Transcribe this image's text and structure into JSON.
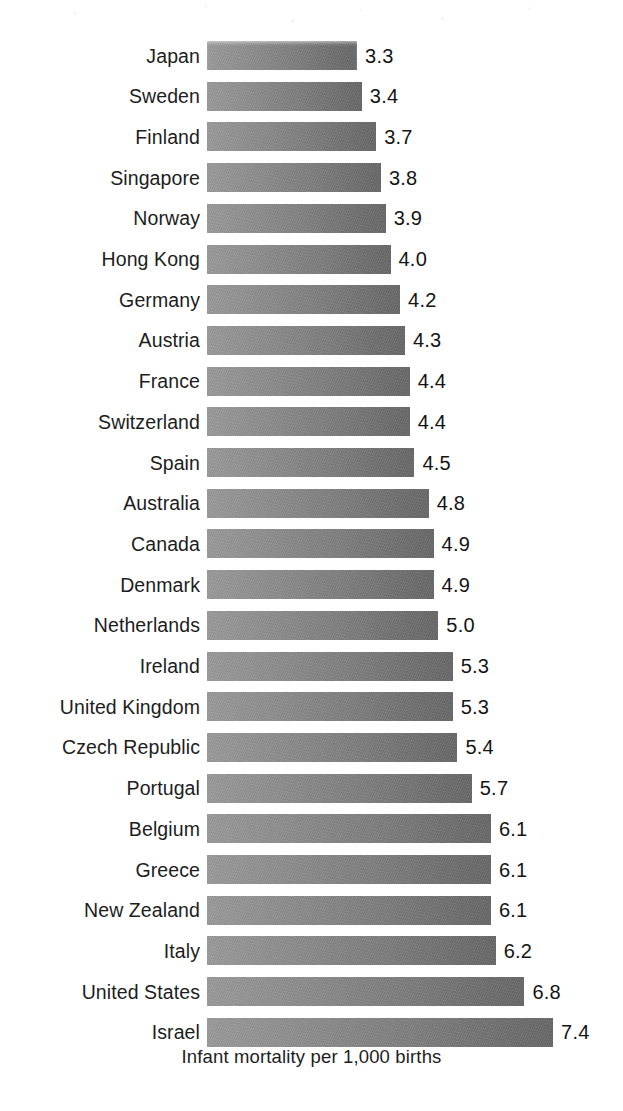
{
  "chart_data": {
    "type": "bar",
    "orientation": "horizontal",
    "title": "",
    "subtitle": "",
    "xlabel": "Infant mortality per 1,000 births",
    "ylabel": "",
    "grid": false,
    "legend": false,
    "value_format": "one-decimal",
    "xlim": [
      0,
      7.4
    ],
    "categories": [
      "Japan",
      "Sweden",
      "Finland",
      "Singapore",
      "Norway",
      "Hong Kong",
      "Germany",
      "Austria",
      "France",
      "Switzerland",
      "Spain",
      "Australia",
      "Canada",
      "Denmark",
      "Netherlands",
      "Ireland",
      "United Kingdom",
      "Czech Republic",
      "Portugal",
      "Belgium",
      "Greece",
      "New Zealand",
      "Italy",
      "United States",
      "Israel"
    ],
    "values": [
      3.3,
      3.4,
      3.7,
      3.8,
      3.9,
      4.0,
      4.2,
      4.3,
      4.4,
      4.4,
      4.5,
      4.8,
      4.9,
      4.9,
      5.0,
      5.3,
      5.3,
      5.4,
      5.7,
      6.1,
      6.1,
      6.1,
      6.2,
      6.8,
      7.4
    ],
    "value_labels": [
      "3.3",
      "3.4",
      "3.7",
      "3.8",
      "3.9",
      "4.0",
      "4.2",
      "4.3",
      "4.4",
      "4.4",
      "4.5",
      "4.8",
      "4.9",
      "4.9",
      "5.0",
      "5.3",
      "5.3",
      "5.4",
      "5.7",
      "6.1",
      "6.1",
      "6.1",
      "6.2",
      "6.8",
      "7.4"
    ],
    "series": [
      {
        "name": "Infant mortality per 1,000 births",
        "values": [
          3.3,
          3.4,
          3.7,
          3.8,
          3.9,
          4.0,
          4.2,
          4.3,
          4.4,
          4.4,
          4.5,
          4.8,
          4.9,
          4.9,
          5.0,
          5.3,
          5.3,
          5.4,
          5.7,
          6.1,
          6.1,
          6.1,
          6.2,
          6.8,
          7.4
        ]
      }
    ]
  },
  "colors": {
    "background": "#ffffff",
    "bar_light": "#9a9a9a",
    "bar_dark": "#686868",
    "text": "#1d1d1d"
  },
  "layout": {
    "bar_origin_x": 207,
    "bar_height": 29,
    "row_pitch": 40.7,
    "first_row_top": 41,
    "px_per_unit": 47.8,
    "value_offset": 0.16,
    "value_label_gap": 8
  }
}
